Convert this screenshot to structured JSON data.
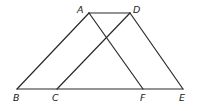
{
  "figure": {
    "points": {
      "A": {
        "label": "A",
        "x": 89,
        "y": 13
      },
      "D": {
        "label": "D",
        "x": 130,
        "y": 13
      },
      "B": {
        "label": "B",
        "x": 17,
        "y": 89
      },
      "C": {
        "label": "C",
        "x": 57,
        "y": 89
      },
      "F": {
        "label": "F",
        "x": 143,
        "y": 89
      },
      "E": {
        "label": "E",
        "x": 183,
        "y": 89
      }
    },
    "segments": [
      {
        "name": "AD",
        "from": "A",
        "to": "D"
      },
      {
        "name": "AB",
        "from": "A",
        "to": "B"
      },
      {
        "name": "AF",
        "from": "A",
        "to": "F"
      },
      {
        "name": "DC",
        "from": "D",
        "to": "C"
      },
      {
        "name": "DE",
        "from": "D",
        "to": "E"
      },
      {
        "name": "BE",
        "from": "B",
        "to": "E"
      }
    ],
    "labels": {
      "A": "A",
      "D": "D",
      "B": "B",
      "C": "C",
      "F": "F",
      "E": "E"
    }
  }
}
